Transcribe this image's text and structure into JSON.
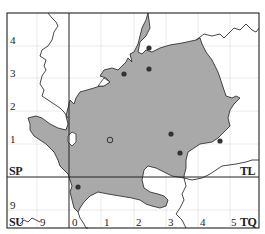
{
  "map": {
    "type": "distribution-map",
    "colors": {
      "frame": "#222222",
      "grid": "#e2e2e2",
      "region_fill": "#a9a9a9",
      "region_outline": "#333333",
      "boundary": "#333333",
      "dot": "#333333"
    },
    "squares": {
      "top_left": "SP",
      "top_right": "TL",
      "bottom_left": "SU",
      "bottom_right": "TQ"
    },
    "y_ticks_left": [
      "4",
      "3",
      "2",
      "1",
      "9"
    ],
    "x_ticks_bottom": [
      "9",
      "0",
      "1",
      "2",
      "3",
      "4",
      "5"
    ],
    "records": {
      "filled_dots": [
        {
          "x": 149,
          "y": 48
        },
        {
          "x": 149,
          "y": 69
        },
        {
          "x": 124,
          "y": 74
        },
        {
          "x": 171,
          "y": 134
        },
        {
          "x": 220,
          "y": 141
        },
        {
          "x": 180,
          "y": 153
        },
        {
          "x": 78,
          "y": 187
        }
      ],
      "open_circles": [
        {
          "x": 110,
          "y": 140
        }
      ]
    }
  }
}
